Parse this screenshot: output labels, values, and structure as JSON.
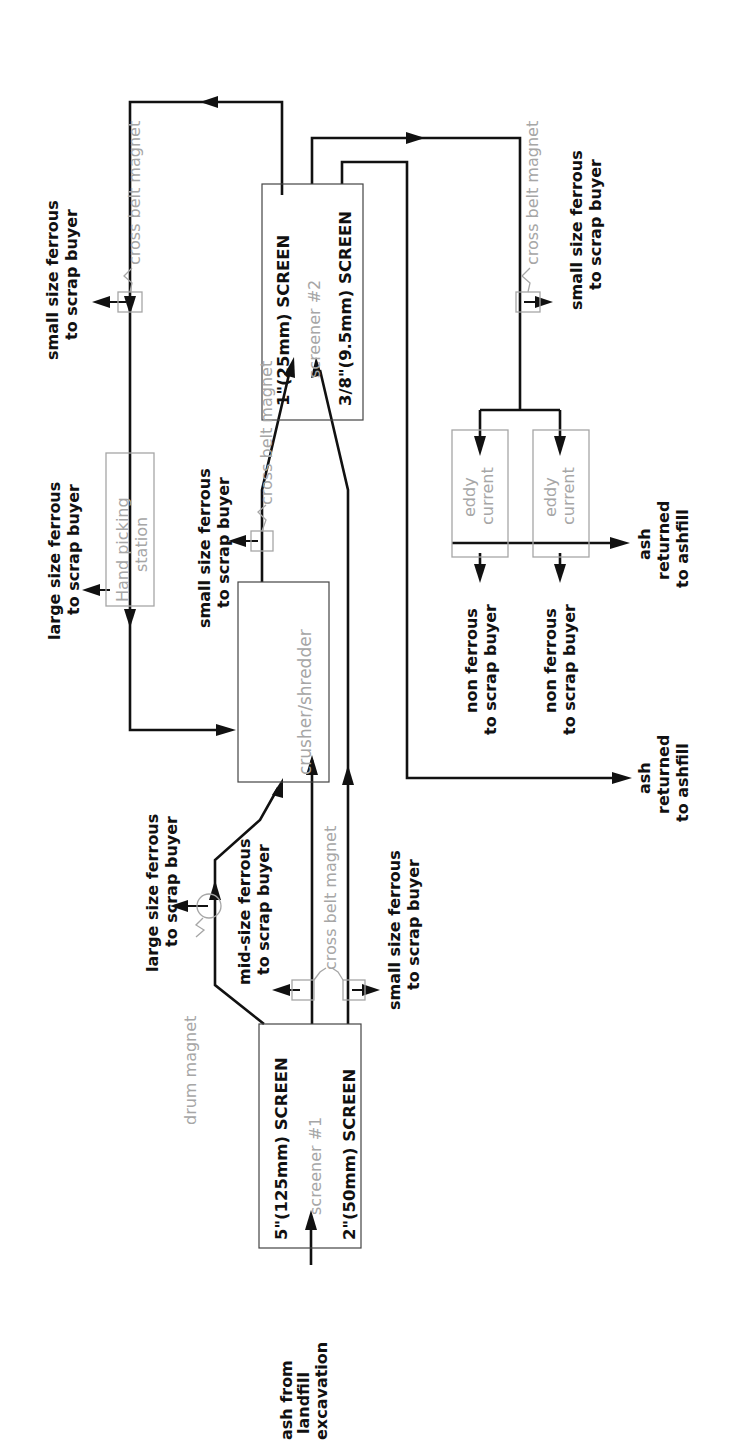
{
  "diagram": {
    "orientation": "rotated-90-ccw",
    "colors": {
      "ink": "#111111",
      "equipment_gray": "#a6a6a6",
      "box_border": "#444444"
    },
    "input": {
      "lines": [
        "ash from",
        "landfill",
        "excavation"
      ]
    },
    "screener1": {
      "title": "screener #1",
      "top_screen": "5\"(125mm) SCREEN",
      "bottom_screen": "2\"(50mm) SCREEN"
    },
    "screener2": {
      "title": "screener #2",
      "top_screen": "1\"(25mm) SCREEN",
      "bottom_screen": "3/8\"(9.5mm) SCREEN"
    },
    "crusher": {
      "label": "crusher/shredder"
    },
    "hand_picking": {
      "lines": [
        "Hand picking",
        "station"
      ]
    },
    "eddy_currents": [
      {
        "lines": [
          "eddy",
          "current"
        ]
      },
      {
        "lines": [
          "eddy",
          "current"
        ]
      }
    ],
    "magnets": {
      "drum": "drum magnet",
      "cross_belt_1": "cross belt magnet",
      "cross_belt_2": "cross belt magnet",
      "cross_belt_3": "cross belt magnet",
      "cross_belt_4": "cross belt magnet"
    },
    "outputs": {
      "large_ferrous_drum": [
        "large size ferrous",
        "to scrap buyer"
      ],
      "mid_ferrous": [
        "mid-size ferrous",
        "to scrap buyer"
      ],
      "small_ferrous_s1": [
        "small size ferrous",
        "to scrap buyer"
      ],
      "large_ferrous_hand": [
        "large size ferrous",
        "to scrap buyer"
      ],
      "small_ferrous_crusher": [
        "small size ferrous",
        "to scrap buyer"
      ],
      "small_ferrous_top": [
        "small size ferrous",
        "to scrap buyer"
      ],
      "small_ferrous_right": [
        "small size ferrous",
        "to scrap buyer"
      ],
      "non_ferrous_1": [
        "non ferrous",
        "to scrap buyer"
      ],
      "non_ferrous_2": [
        "non ferrous",
        "to scrap buyer"
      ],
      "ash_eddy": [
        "ash",
        "returned",
        "to ashfill"
      ],
      "ash_fine": [
        "ash",
        "returned",
        "to ashfill"
      ]
    }
  }
}
